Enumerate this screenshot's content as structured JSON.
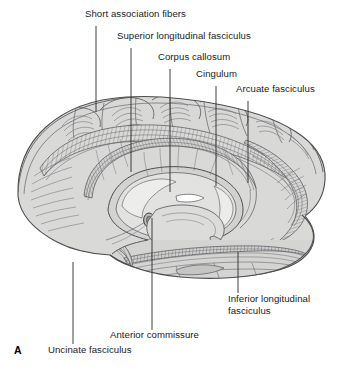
{
  "figure": {
    "panel_letter": "A",
    "background_color": "#ffffff",
    "brain_fill_color": "#d9d9d7",
    "brain_shade_color": "#bdbdba",
    "brain_line_color": "#58585a",
    "leader_line_color": "#2b2b2b",
    "label_text_color": "#1b1b1b"
  },
  "labels": [
    {
      "id": "short-association-fibers",
      "text": "Short association fibers",
      "text_x": 85,
      "text_y": 14,
      "leader": {
        "x1": 96,
        "y1": 26,
        "x2": 96,
        "y2": 112
      }
    },
    {
      "id": "superior-longitudinal-fasciculus",
      "text": "Superior longitudinal fasciculus",
      "text_x": 117,
      "text_y": 36,
      "leader": {
        "x1": 131,
        "y1": 48,
        "x2": 131,
        "y2": 172
      }
    },
    {
      "id": "corpus-callosum",
      "text": "Corpus callosum",
      "text_x": 158,
      "text_y": 57,
      "leader": {
        "x1": 170,
        "y1": 69,
        "x2": 170,
        "y2": 192
      }
    },
    {
      "id": "cingulum",
      "text": "Cingulum",
      "text_x": 196,
      "text_y": 74,
      "leader": {
        "x1": 216,
        "y1": 86,
        "x2": 216,
        "y2": 186
      }
    },
    {
      "id": "arcuate-fasciculus",
      "text": "Arcuate fasciculus",
      "text_x": 236,
      "text_y": 89,
      "leader": {
        "x1": 248,
        "y1": 101,
        "x2": 248,
        "y2": 183
      }
    },
    {
      "id": "inferior-longitudinal-fasciculus",
      "text": "Inferior longitudinal fasciculus",
      "text_x": 228,
      "text_y": 296,
      "leader": {
        "x1": 238,
        "y1": 252,
        "x2": 238,
        "y2": 293
      }
    },
    {
      "id": "anterior-commissure",
      "text": "Anterior commissure",
      "text_x": 110,
      "text_y": 334,
      "leader": {
        "x1": 152,
        "y1": 218,
        "x2": 152,
        "y2": 330
      }
    },
    {
      "id": "uncinate-fasciculus",
      "text": "Uncinate fasciculus",
      "text_x": 48,
      "text_y": 348,
      "leader": {
        "x1": 73,
        "y1": 262,
        "x2": 73,
        "y2": 344
      }
    }
  ]
}
